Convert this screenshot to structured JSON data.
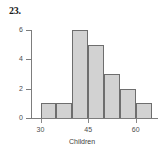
{
  "problem": {
    "number": "23."
  },
  "chart_data": {
    "type": "bar",
    "title": "",
    "subtitle": "",
    "xlabel": "Children",
    "ylabel": "",
    "grid": false,
    "legend": false,
    "bin_width": 5,
    "bin_starts": [
      30,
      35,
      40,
      45,
      50,
      55,
      60
    ],
    "bin_ends": [
      35,
      40,
      45,
      50,
      55,
      60,
      65
    ],
    "categories": [
      "30-35",
      "35-40",
      "40-45",
      "45-50",
      "50-55",
      "55-60",
      "60-65"
    ],
    "values": [
      1,
      1,
      6,
      5,
      3,
      2,
      1
    ],
    "xlim": [
      27,
      67
    ],
    "ylim": [
      0,
      6
    ],
    "xticks": [
      30,
      45,
      60
    ],
    "xtick_labels": [
      "30",
      "45",
      "60"
    ],
    "yticks": [
      0,
      2,
      4,
      6
    ],
    "ytick_labels": [
      "0",
      "2",
      "4",
      "6"
    ],
    "bar_color": "#d2d2d2",
    "bar_edge_color": "#6e6e6e",
    "axis_color": "#7d7d7d"
  }
}
